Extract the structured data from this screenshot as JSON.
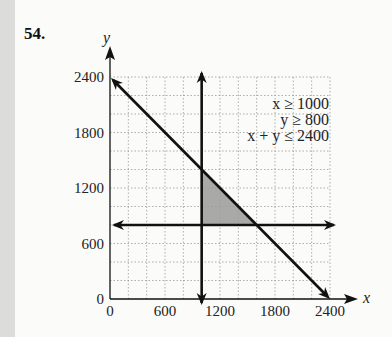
{
  "problem_number": "54.",
  "chart_data": {
    "type": "line",
    "title": "",
    "xlabel": "x",
    "ylabel": "y",
    "xlim": [
      0,
      2400
    ],
    "ylim": [
      0,
      2400
    ],
    "x_ticks": [
      "0",
      "600",
      "1200",
      "1800",
      "2400"
    ],
    "y_ticks": [
      "0",
      "600",
      "1200",
      "1800",
      "2400"
    ],
    "grid": true,
    "grid_step": 200,
    "constraints": [
      "x ≥ 1000",
      "y ≥ 800",
      "x + y ≤ 2400"
    ],
    "lines": [
      {
        "name": "x = 1000",
        "points": [
          [
            1000,
            0
          ],
          [
            1000,
            2400
          ]
        ]
      },
      {
        "name": "y = 800",
        "points": [
          [
            0,
            800
          ],
          [
            2400,
            800
          ]
        ]
      },
      {
        "name": "x + y = 2400",
        "points": [
          [
            0,
            2400
          ],
          [
            2400,
            0
          ]
        ]
      }
    ],
    "feasible_region": {
      "vertices": [
        [
          1000,
          800
        ],
        [
          1600,
          800
        ],
        [
          1000,
          1400
        ]
      ],
      "fill": "#9a9a9a"
    },
    "legend_position": "top-right"
  }
}
